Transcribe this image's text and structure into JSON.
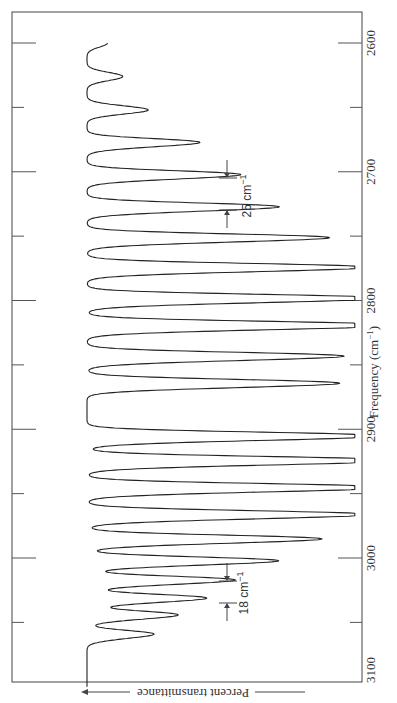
{
  "chart_data": {
    "type": "line",
    "title": "",
    "orientation": "rotated 90° (frequency axis vertical, transmittance horizontal)",
    "xlabel": "Frequency (cm⁻¹)",
    "ylabel": "Percent transmittance",
    "xlim": [
      3100,
      2600
    ],
    "x_ticks": [
      3100,
      3000,
      2900,
      2800,
      2700,
      2600
    ],
    "x_tick_labels": [
      "3100",
      "3000",
      "2900",
      "2800",
      "2700",
      "2600"
    ],
    "minor_ticks": [
      3050,
      2950,
      2850,
      2750,
      2650
    ],
    "grid": false,
    "legend": null,
    "annotations": [
      {
        "text": "25 cm⁻¹",
        "near_frequency": 2720,
        "meaning": "line spacing in P branch"
      },
      {
        "text": "18 cm⁻¹",
        "near_frequency": 3010,
        "meaning": "line spacing in R branch"
      }
    ],
    "series": [
      {
        "name": "Main isotope absorption (relative depth, 0 = baseline, 1 = strongest)",
        "peaks": [
          {
            "x": 3060,
            "depth": 0.2
          },
          {
            "x": 3045,
            "depth": 0.28
          },
          {
            "x": 3032,
            "depth": 0.36
          },
          {
            "x": 3018,
            "depth": 0.44
          },
          {
            "x": 3003,
            "depth": 0.58
          },
          {
            "x": 2986,
            "depth": 0.72
          },
          {
            "x": 2967,
            "depth": 0.88
          },
          {
            "x": 2946,
            "depth": 0.95
          },
          {
            "x": 2925,
            "depth": 1.0
          },
          {
            "x": 2906,
            "depth": 0.93
          },
          {
            "x": 2865,
            "depth": 0.8
          },
          {
            "x": 2844,
            "depth": 0.8
          },
          {
            "x": 2820,
            "depth": 0.98
          },
          {
            "x": 2799,
            "depth": 0.93
          },
          {
            "x": 2775,
            "depth": 0.88
          },
          {
            "x": 2752,
            "depth": 0.75
          },
          {
            "x": 2728,
            "depth": 0.6
          },
          {
            "x": 2703,
            "depth": 0.48
          },
          {
            "x": 2678,
            "depth": 0.35
          },
          {
            "x": 2652,
            "depth": 0.24
          },
          {
            "x": 2626,
            "depth": 0.14
          },
          {
            "x": 2600,
            "depth": 0.08
          }
        ]
      },
      {
        "name": "Isotope satellite lines (relative depth)",
        "peaks": [
          {
            "x": 3058,
            "depth": 0.08
          },
          {
            "x": 3043,
            "depth": 0.1
          },
          {
            "x": 3030,
            "depth": 0.14
          },
          {
            "x": 3016,
            "depth": 0.18
          },
          {
            "x": 3001,
            "depth": 0.22
          },
          {
            "x": 2984,
            "depth": 0.26
          },
          {
            "x": 2965,
            "depth": 0.3
          },
          {
            "x": 2944,
            "depth": 0.33
          },
          {
            "x": 2923,
            "depth": 0.32
          },
          {
            "x": 2904,
            "depth": 0.3
          },
          {
            "x": 2863,
            "depth": 0.25
          },
          {
            "x": 2842,
            "depth": 0.27
          },
          {
            "x": 2818,
            "depth": 0.33
          },
          {
            "x": 2797,
            "depth": 0.32
          },
          {
            "x": 2773,
            "depth": 0.3
          },
          {
            "x": 2750,
            "depth": 0.26
          },
          {
            "x": 2726,
            "depth": 0.2
          },
          {
            "x": 2701,
            "depth": 0.16
          },
          {
            "x": 2676,
            "depth": 0.12
          }
        ]
      }
    ],
    "layout": {
      "frame_px": {
        "left": 12,
        "top": 12,
        "right": 362,
        "bottom": 682
      },
      "baseline_x_px": 87,
      "max_depth_px": 255,
      "freq_to_y": {
        "f0": 2600,
        "y0": 43,
        "px_per_unit": 1.2875
      }
    }
  },
  "labels": {
    "ylabel_text": "Percent transmittance",
    "xlabel_main": "Frequency (cm",
    "xlabel_sup": "−1",
    "xlabel_close": ")",
    "annot_25": "25 cm",
    "annot_18": "18 cm",
    "annot_sup": "−1"
  }
}
